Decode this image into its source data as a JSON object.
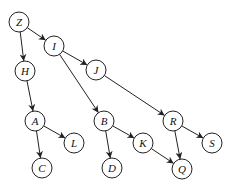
{
  "diagram": {
    "type": "directed-graph",
    "nodes": [
      {
        "id": "Z",
        "label": "Z",
        "x": 19,
        "y": 22
      },
      {
        "id": "I",
        "label": "I",
        "x": 54,
        "y": 46
      },
      {
        "id": "H",
        "label": "H",
        "x": 25,
        "y": 71
      },
      {
        "id": "J",
        "label": "J",
        "x": 96,
        "y": 70
      },
      {
        "id": "A",
        "label": "A",
        "x": 35,
        "y": 121
      },
      {
        "id": "L",
        "label": "L",
        "x": 74,
        "y": 143
      },
      {
        "id": "C",
        "label": "C",
        "x": 42,
        "y": 168
      },
      {
        "id": "B",
        "label": "B",
        "x": 104,
        "y": 121
      },
      {
        "id": "K",
        "label": "K",
        "x": 143,
        "y": 143
      },
      {
        "id": "D",
        "label": "D",
        "x": 112,
        "y": 168
      },
      {
        "id": "R",
        "label": "R",
        "x": 173,
        "y": 121
      },
      {
        "id": "S",
        "label": "S",
        "x": 212,
        "y": 143
      },
      {
        "id": "Q",
        "label": "Q",
        "x": 182,
        "y": 169
      }
    ],
    "edges": [
      {
        "from": "Z",
        "to": "I"
      },
      {
        "from": "Z",
        "to": "H"
      },
      {
        "from": "I",
        "to": "J"
      },
      {
        "from": "I",
        "to": "B"
      },
      {
        "from": "H",
        "to": "A"
      },
      {
        "from": "J",
        "to": "R"
      },
      {
        "from": "A",
        "to": "L"
      },
      {
        "from": "A",
        "to": "C"
      },
      {
        "from": "B",
        "to": "K"
      },
      {
        "from": "B",
        "to": "D"
      },
      {
        "from": "K",
        "to": "Q"
      },
      {
        "from": "R",
        "to": "S"
      },
      {
        "from": "R",
        "to": "Q"
      }
    ],
    "node_radius": 10,
    "colors": {
      "stroke": "#222222",
      "fill": "#ffffff",
      "text": "#111111"
    }
  }
}
